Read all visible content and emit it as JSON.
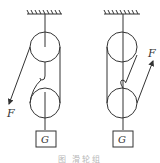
{
  "figure": {
    "caption": "图  滑轮组",
    "stroke_color": "#333333",
    "diagrams": [
      {
        "id": "left",
        "force_label": "F",
        "load_label": "G",
        "force_direction": "down-left"
      },
      {
        "id": "right",
        "force_label": "F",
        "load_label": "G",
        "force_direction": "up-right"
      }
    ]
  }
}
